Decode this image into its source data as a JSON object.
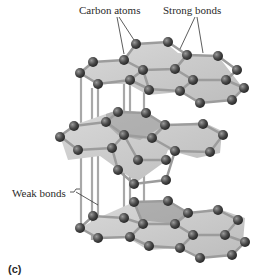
{
  "figure": {
    "panel_label": "(c)"
  },
  "labels": {
    "carbon_atoms": "Carbon atoms",
    "strong_bonds": "Strong bonds",
    "weak_bonds": "Weak bonds"
  },
  "colors": {
    "sheet_fill": "#cfcfcf",
    "sheet_fill_dark": "#a9a9a9",
    "bond": "#9a9a9a",
    "atom": "#4a4a4a",
    "atom_highlight": "#8a8a8a",
    "leader_line": "#333333",
    "text": "#2a2a2a"
  }
}
